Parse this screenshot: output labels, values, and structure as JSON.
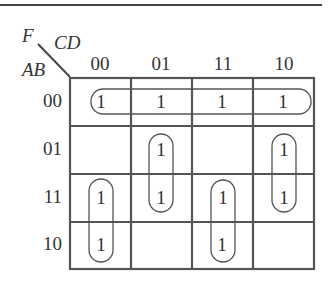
{
  "diagram": {
    "type": "karnaugh-map",
    "function_label": "F",
    "column_variables": "CD",
    "row_variables": "AB",
    "column_labels": [
      "00",
      "01",
      "11",
      "10"
    ],
    "row_labels": [
      "00",
      "01",
      "11",
      "10"
    ],
    "cells": [
      [
        "1",
        "1",
        "1",
        "1"
      ],
      [
        "",
        "1",
        "",
        "1"
      ],
      [
        "1",
        "1",
        "1",
        "1"
      ],
      [
        "1",
        "",
        "1",
        ""
      ]
    ],
    "groups": [
      {
        "name": "row-00-all-columns",
        "rows": [
          0
        ],
        "cols": [
          0,
          1,
          2,
          3
        ]
      },
      {
        "name": "col-01-rows-01-11",
        "rows": [
          1,
          2
        ],
        "cols": [
          1
        ]
      },
      {
        "name": "col-10-rows-01-11",
        "rows": [
          1,
          2
        ],
        "cols": [
          3
        ]
      },
      {
        "name": "col-00-rows-11-10",
        "rows": [
          2,
          3
        ],
        "cols": [
          0
        ]
      },
      {
        "name": "col-11-rows-11-10",
        "rows": [
          2,
          3
        ],
        "cols": [
          2
        ]
      }
    ]
  }
}
